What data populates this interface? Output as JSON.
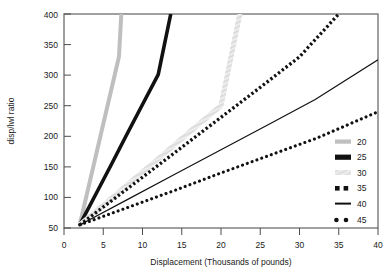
{
  "chart_data": {
    "type": "line",
    "title": "",
    "xlabel": "Displacement (Thousands of pounds)",
    "ylabel": "disp/lwl ratio",
    "xlim": [
      0,
      40
    ],
    "ylim": [
      50,
      400
    ],
    "xticks": [
      "0",
      "5",
      "10",
      "15",
      "20",
      "25",
      "30",
      "35",
      "40"
    ],
    "xtick_values": [
      0,
      5,
      10,
      15,
      20,
      25,
      30,
      35,
      40
    ],
    "yticks": [
      "50",
      "100",
      "150",
      "200",
      "250",
      "300",
      "350",
      "400"
    ],
    "ytick_values": [
      50,
      100,
      150,
      200,
      250,
      300,
      350,
      400
    ],
    "grid": false,
    "legend_position": "right",
    "legend_title": "",
    "x_origin": 2.0,
    "y_origin": 55,
    "series": [
      {
        "name": "20",
        "label": "20",
        "style": "thick-gray",
        "color": "#bfbfbf",
        "width": 4.0,
        "dash": "none",
        "x": [
          2,
          3,
          4,
          5,
          6,
          7,
          7.3
        ],
        "y": [
          55,
          110,
          165,
          220,
          275,
          330,
          400
        ]
      },
      {
        "name": "25",
        "label": "25",
        "style": "thick-black",
        "color": "#111111",
        "width": 3.6,
        "dash": "none",
        "x": [
          2,
          4,
          6,
          8,
          10,
          12,
          13.6
        ],
        "y": [
          55,
          104,
          153,
          203,
          252,
          301,
          400
        ]
      },
      {
        "name": "30",
        "label": "30",
        "style": "hatched-lightgray",
        "color": "#d9d9d9",
        "width": 4.5,
        "dash": "none",
        "x": [
          2,
          5,
          8,
          12,
          16,
          20,
          22.4
        ],
        "y": [
          55,
          87,
          120,
          163,
          207,
          250,
          400
        ]
      },
      {
        "name": "35",
        "label": "35",
        "style": "square-dotted",
        "color": "#111111",
        "width": 3.2,
        "dash": "2.2 2.2",
        "x": [
          2,
          6,
          10,
          15,
          20,
          25,
          30,
          35
        ],
        "y": [
          55,
          94,
          133,
          182,
          231,
          280,
          330,
          400
        ]
      },
      {
        "name": "40",
        "label": "40",
        "style": "thin-solid",
        "color": "#111111",
        "width": 1.2,
        "dash": "none",
        "x": [
          2,
          8,
          14,
          20,
          26,
          32,
          40
        ],
        "y": [
          55,
          96,
          137,
          178,
          219,
          260,
          325
        ]
      },
      {
        "name": "45",
        "label": "45",
        "style": "round-dotted",
        "color": "#111111",
        "width": 3.0,
        "dash": "0.1 4.6",
        "x": [
          2,
          8,
          14,
          20,
          26,
          32,
          40
        ],
        "y": [
          55,
          83,
          111,
          140,
          168,
          196,
          240
        ]
      }
    ]
  },
  "legend": {
    "items": [
      {
        "label": "20",
        "swatch": "thick-gray"
      },
      {
        "label": "25",
        "swatch": "thick-black"
      },
      {
        "label": "30",
        "swatch": "hatched-lightgray"
      },
      {
        "label": "35",
        "swatch": "square-dotted"
      },
      {
        "label": "40",
        "swatch": "thin-solid"
      },
      {
        "label": "45",
        "swatch": "round-dotted"
      }
    ]
  },
  "axes": {
    "x_title": "Displacement (Thousands of pounds)",
    "y_title": "disp/lwl ratio",
    "x_labels": [
      "0",
      "5",
      "10",
      "15",
      "20",
      "25",
      "30",
      "35",
      "40"
    ],
    "y_labels": [
      "50",
      "100",
      "150",
      "200",
      "250",
      "300",
      "350",
      "400"
    ]
  }
}
